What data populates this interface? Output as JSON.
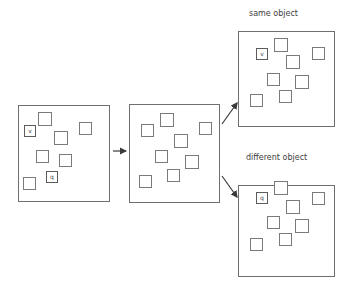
{
  "figure": {
    "title": "",
    "background_color": "#ffffff",
    "stroke_color": "#6f6f6f",
    "text_color": "#3d3d3d"
  },
  "captions": {
    "same_object": "same object",
    "different_object": "different object"
  },
  "panels": [
    {
      "id": "sample-display",
      "name": "sample-display-panel",
      "x": 18,
      "y": 105,
      "width": 92,
      "height": 97,
      "items": [
        {
          "x": 38,
          "y": 112,
          "size": 14,
          "label": ""
        },
        {
          "x": 79,
          "y": 122,
          "size": 13,
          "label": ""
        },
        {
          "x": 24,
          "y": 125,
          "size": 12,
          "label": "v"
        },
        {
          "x": 54,
          "y": 131,
          "size": 14,
          "label": ""
        },
        {
          "x": 36,
          "y": 150,
          "size": 13,
          "label": ""
        },
        {
          "x": 59,
          "y": 154,
          "size": 13,
          "label": ""
        },
        {
          "x": 46,
          "y": 171,
          "size": 12,
          "label": "q"
        },
        {
          "x": 23,
          "y": 177,
          "size": 13,
          "label": ""
        }
      ]
    },
    {
      "id": "delay-display",
      "name": "delay-display-panel",
      "x": 129,
      "y": 104,
      "width": 91,
      "height": 99,
      "items": [
        {
          "x": 160,
          "y": 113,
          "size": 14,
          "label": ""
        },
        {
          "x": 141,
          "y": 124,
          "size": 13,
          "label": ""
        },
        {
          "x": 199,
          "y": 122,
          "size": 13,
          "label": ""
        },
        {
          "x": 174,
          "y": 134,
          "size": 14,
          "label": ""
        },
        {
          "x": 155,
          "y": 150,
          "size": 13,
          "label": ""
        },
        {
          "x": 185,
          "y": 155,
          "size": 14,
          "label": ""
        },
        {
          "x": 167,
          "y": 169,
          "size": 13,
          "label": ""
        },
        {
          "x": 139,
          "y": 175,
          "size": 13,
          "label": ""
        }
      ]
    },
    {
      "id": "test-same",
      "name": "same-object-test-panel",
      "x": 238,
      "y": 31,
      "width": 97,
      "height": 96,
      "items": [
        {
          "x": 274,
          "y": 38,
          "size": 14,
          "label": ""
        },
        {
          "x": 312,
          "y": 47,
          "size": 13,
          "label": ""
        },
        {
          "x": 256,
          "y": 48,
          "size": 12,
          "label": "v"
        },
        {
          "x": 286,
          "y": 55,
          "size": 14,
          "label": ""
        },
        {
          "x": 267,
          "y": 73,
          "size": 13,
          "label": ""
        },
        {
          "x": 295,
          "y": 75,
          "size": 14,
          "label": ""
        },
        {
          "x": 279,
          "y": 90,
          "size": 13,
          "label": ""
        },
        {
          "x": 250,
          "y": 94,
          "size": 13,
          "label": ""
        }
      ]
    },
    {
      "id": "test-different",
      "name": "different-object-test-panel",
      "x": 238,
      "y": 185,
      "width": 97,
      "height": 92,
      "items": [
        {
          "x": 274,
          "y": 181,
          "size": 14,
          "label": ""
        },
        {
          "x": 312,
          "y": 192,
          "size": 13,
          "label": ""
        },
        {
          "x": 256,
          "y": 192,
          "size": 12,
          "label": "q"
        },
        {
          "x": 286,
          "y": 200,
          "size": 14,
          "label": ""
        },
        {
          "x": 267,
          "y": 216,
          "size": 13,
          "label": ""
        },
        {
          "x": 295,
          "y": 219,
          "size": 14,
          "label": ""
        },
        {
          "x": 279,
          "y": 233,
          "size": 13,
          "label": ""
        },
        {
          "x": 250,
          "y": 238,
          "size": 13,
          "label": ""
        }
      ]
    }
  ],
  "arrows": [
    {
      "id": "sample-to-delay",
      "name": "arrow-sample-to-delay",
      "x1": 113,
      "y1": 151,
      "x2": 126,
      "y2": 151
    },
    {
      "id": "delay-to-same",
      "name": "arrow-delay-to-same",
      "x1": 222,
      "y1": 124,
      "x2": 237,
      "y2": 103
    },
    {
      "id": "delay-to-different",
      "name": "arrow-delay-to-different",
      "x1": 222,
      "y1": 176,
      "x2": 237,
      "y2": 197
    }
  ],
  "caption_positions": {
    "same_object": {
      "x": 249,
      "y": 9
    },
    "different_object": {
      "x": 246,
      "y": 153
    }
  }
}
